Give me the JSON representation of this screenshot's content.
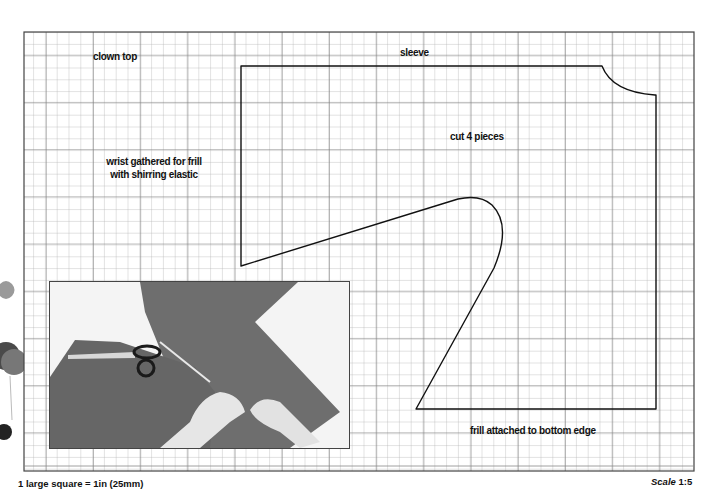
{
  "pattern": {
    "title": "clown top",
    "piece_name": "sleeve",
    "instructions": {
      "cut": "cut 4 pieces",
      "wrist_line1": "wrist gathered for frill",
      "wrist_line2": "with shirring elastic",
      "bottom": "frill attached to bottom edge"
    }
  },
  "footer": {
    "grid_key": "1 large square = 1in (25mm)",
    "scale_label": "Scale",
    "scale_value": "1:5"
  },
  "photo": {
    "description": "hands pinning red fabric sleeve pieces with pinking shears",
    "fabric_color": "#6b6b6b"
  },
  "colors": {
    "grid_minor": "#b5b5b5",
    "grid_major": "#7a7a7a",
    "outline": "#111111"
  }
}
